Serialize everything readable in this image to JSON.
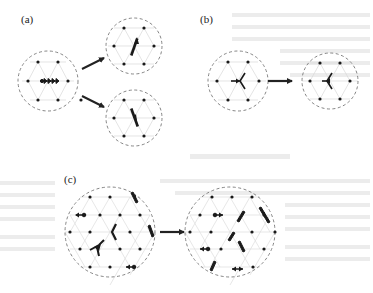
{
  "figure": {
    "panels": [
      {
        "id": "a",
        "label": "(a)",
        "label_pos": [
          21,
          13
        ]
      },
      {
        "id": "b",
        "label": "(b)",
        "label_pos": [
          200,
          13
        ]
      },
      {
        "id": "c",
        "label": "(c)",
        "label_pos": [
          64,
          173
        ]
      }
    ],
    "colors": {
      "dot": "#1a1a1a",
      "circle_dash": "#777777",
      "lattice_line": "#d6d6d6",
      "arrow": "#222222",
      "bleed_text": "#e4e4e4"
    },
    "circles": [
      {
        "panel": "a",
        "name": "a-initial",
        "cx": 48,
        "cy": 81,
        "r": 30,
        "lattice": 20
      },
      {
        "panel": "a",
        "name": "a-result-top",
        "cx": 134,
        "cy": 46,
        "r": 28,
        "lattice": 20
      },
      {
        "panel": "a",
        "name": "a-result-bottom",
        "cx": 134,
        "cy": 118,
        "r": 28,
        "lattice": 20
      },
      {
        "panel": "b",
        "name": "b-initial",
        "cx": 238,
        "cy": 81,
        "r": 30,
        "lattice": 21
      },
      {
        "panel": "b",
        "name": "b-result",
        "cx": 330,
        "cy": 81,
        "r": 28,
        "lattice": 20
      },
      {
        "panel": "c",
        "name": "c-initial",
        "cx": 110,
        "cy": 232,
        "r": 45,
        "lattice": 20
      },
      {
        "panel": "c",
        "name": "c-result",
        "cx": 230,
        "cy": 232,
        "r": 45,
        "lattice": 20
      }
    ],
    "transition_arrows": [
      {
        "panel": "a",
        "from": [
          82,
          69
        ],
        "to": [
          104,
          58
        ]
      },
      {
        "panel": "a",
        "from": [
          82,
          96
        ],
        "to": [
          104,
          107
        ]
      },
      {
        "panel": "b",
        "from": [
          268,
          81
        ],
        "to": [
          292,
          81
        ]
      },
      {
        "panel": "c",
        "from": [
          160,
          232
        ],
        "to": [
          184,
          232
        ]
      }
    ]
  }
}
